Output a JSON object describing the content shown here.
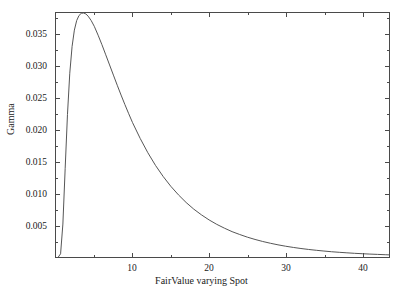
{
  "chart_data": {
    "type": "line",
    "title": "",
    "xlabel": "FairValue varying Spot",
    "ylabel": "Gamma",
    "xlim": [
      0,
      43.5
    ],
    "ylim": [
      0,
      0.0385
    ],
    "grid": false,
    "legend": null,
    "x_ticks_major": [
      10,
      20,
      30,
      40
    ],
    "x_tick_labels": [
      "10",
      "20",
      "30",
      "40"
    ],
    "x_ticks_minor": [
      5,
      15,
      25,
      35
    ],
    "y_ticks_major": [
      0.005,
      0.01,
      0.015,
      0.02,
      0.025,
      0.03,
      0.035
    ],
    "y_tick_labels": [
      "0.005",
      "0.010",
      "0.015",
      "0.020",
      "0.025",
      "0.030",
      "0.035"
    ],
    "y_ticks_minor": [
      0.0025,
      0.0075,
      0.0125,
      0.0175,
      0.0225,
      0.0275,
      0.0325,
      0.0375
    ],
    "series": [
      {
        "name": "Gamma",
        "color": "#555555",
        "x": [
          0.3,
          0.6,
          0.9,
          1.2,
          1.5,
          1.8,
          2.1,
          2.4,
          2.7,
          3.0,
          3.3,
          3.6,
          3.9,
          4.2,
          4.6,
          5.0,
          5.5,
          6.0,
          6.5,
          7.0,
          7.5,
          8.0,
          8.5,
          9.0,
          9.5,
          10.0,
          11.0,
          12.0,
          13.0,
          14.0,
          15.0,
          16.0,
          17.0,
          18.0,
          19.0,
          20.0,
          21.0,
          22.0,
          23.0,
          24.0,
          25.0,
          26.0,
          27.0,
          28.0,
          29.0,
          30.0,
          31.0,
          32.0,
          33.0,
          34.0,
          35.0,
          36.0,
          37.0,
          38.0,
          39.0,
          40.0,
          41.0,
          42.0,
          43.0,
          43.5
        ],
        "y": [
          0.0,
          0.0005,
          0.0052,
          0.014,
          0.0225,
          0.029,
          0.0332,
          0.0358,
          0.0373,
          0.0381,
          0.03845,
          0.0385,
          0.03835,
          0.038,
          0.0373,
          0.0364,
          0.035,
          0.0335,
          0.0319,
          0.0303,
          0.0287,
          0.0271,
          0.02555,
          0.02405,
          0.0226,
          0.0212,
          0.0187,
          0.01645,
          0.01445,
          0.0127,
          0.01115,
          0.0098,
          0.0086,
          0.00755,
          0.00665,
          0.00585,
          0.00515,
          0.00455,
          0.004,
          0.00355,
          0.00313,
          0.00277,
          0.00245,
          0.00217,
          0.00192,
          0.0017,
          0.00151,
          0.00134,
          0.00119,
          0.00106,
          0.00094,
          0.00083,
          0.00074,
          0.00066,
          0.00058,
          0.00052,
          0.00046,
          0.00041,
          0.00036,
          0.00034
        ]
      }
    ]
  },
  "figure": {
    "clipped_top_text": "",
    "frame_color": "#4a4a4a",
    "background": "#ffffff"
  }
}
